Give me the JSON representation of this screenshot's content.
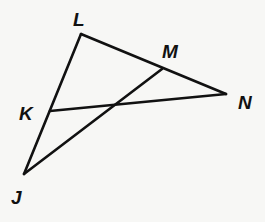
{
  "diagram": {
    "points": {
      "L": {
        "label": "L",
        "x": 81,
        "y": 34,
        "lx": 73,
        "ly": 26
      },
      "M": {
        "label": "M",
        "x": 162,
        "y": 69,
        "lx": 162,
        "ly": 58
      },
      "N": {
        "label": "N",
        "x": 226,
        "y": 94,
        "lx": 238,
        "ly": 109
      },
      "K": {
        "label": "K",
        "x": 50,
        "y": 111,
        "lx": 19,
        "ly": 120
      },
      "J": {
        "label": "J",
        "x": 24,
        "y": 174,
        "lx": 11,
        "ly": 204
      }
    },
    "segments": [
      [
        "J",
        "L"
      ],
      [
        "L",
        "N"
      ],
      [
        "K",
        "N"
      ],
      [
        "J",
        "M"
      ]
    ]
  }
}
